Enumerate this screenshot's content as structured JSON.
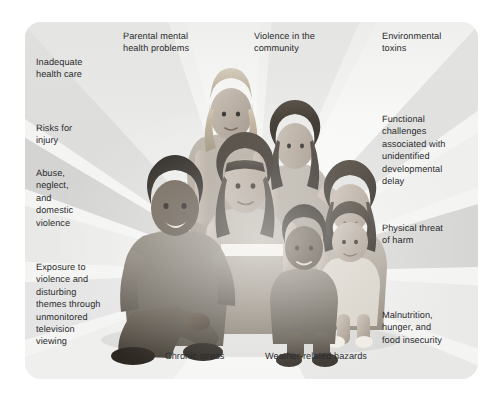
{
  "figure": {
    "type": "illustration-with-radial-callouts",
    "panel": {
      "background_color": "#f2f2f1",
      "ray_light_color": "#f7f7f6",
      "ray_mid_color": "#e4e4e2",
      "ray_dark_color": "#d2d2d0",
      "corner_radius_px": 16
    },
    "subject_description": "Illustrated group of a kneeling adult man and six children and teenagers of varied ethnicities posed together in the center of the panel.",
    "text_color": "#2b2b2d"
  },
  "labels": [
    {
      "id": "inadequate-health-care",
      "text": "Inadequate\nhealth care"
    },
    {
      "id": "parental-mental-health",
      "text": "Parental mental\nhealth problems"
    },
    {
      "id": "violence-in-the-community",
      "text": "Violence in the\ncommunity"
    },
    {
      "id": "environmental-toxins",
      "text": "Environmental\ntoxins"
    },
    {
      "id": "risks-for-injury",
      "text": "Risks for\ninjury"
    },
    {
      "id": "functional-challenges",
      "text": "Functional\nchallenges\nassociated with\nunidentified\ndevelopmental\ndelay"
    },
    {
      "id": "abuse-neglect-domestic-violence",
      "text": "Abuse,\nneglect,\nand\ndomestic\nviolence"
    },
    {
      "id": "physical-threat-of-harm",
      "text": "Physical threat\nof harm"
    },
    {
      "id": "exposure-to-violence-tv",
      "text": "Exposure to\nviolence and\ndisturbing\nthemes through\nunmonitored\ntelevision\nviewing"
    },
    {
      "id": "malnutrition-hunger",
      "text": "Malnutrition,\nhunger, and\nfood insecurity"
    },
    {
      "id": "chronic-stress",
      "text": "Chronic stress"
    },
    {
      "id": "weather-related-hazards",
      "text": "Weather-related hazards"
    }
  ]
}
